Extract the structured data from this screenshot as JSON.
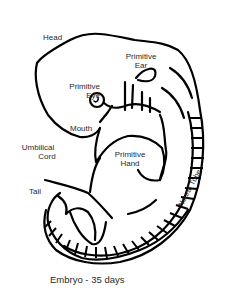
{
  "figure": {
    "caption": "Embryo - 35 days",
    "labels": {
      "head": "Head",
      "ear_1": "Primitive",
      "ear_2": "Ear",
      "eye_1": "Primitive",
      "eye_2": "Eye",
      "mouth": "Mouth",
      "umbilical_1": "Umbilical",
      "umbilical_2": "Cord",
      "hand_1": "Primitive",
      "hand_2": "Hand",
      "tail": "Tail",
      "neural_tube": "Neural Tube"
    },
    "colors": {
      "line": "#000000",
      "text": "#2a2a2a",
      "background": "#ffffff"
    }
  }
}
